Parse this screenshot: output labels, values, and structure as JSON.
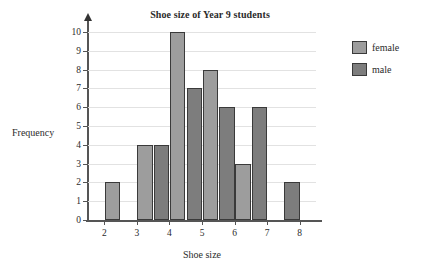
{
  "chart_data": {
    "type": "bar",
    "title": "Shoe size of Year 9 students",
    "xlabel": "Shoe size",
    "ylabel": "Frequency",
    "categories": [
      "2",
      "3",
      "4",
      "5",
      "6",
      "7",
      "8"
    ],
    "xlim": [
      1.5,
      8.5
    ],
    "ylim": [
      0,
      10
    ],
    "ytick_labels": [
      "0",
      "1",
      "2",
      "3",
      "4",
      "5",
      "6",
      "7",
      "8",
      "9",
      "10"
    ],
    "grid": true,
    "legend_position": "right",
    "series": [
      {
        "name": "female",
        "color": "#9d9d9d",
        "values": [
          2,
          4,
          10,
          8,
          3,
          0,
          0
        ]
      },
      {
        "name": "male",
        "color": "#7d7d7d",
        "values": [
          0,
          0,
          4,
          7,
          6,
          6,
          2
        ]
      }
    ],
    "bars": [
      {
        "size": "2",
        "group": "female",
        "value": 2
      },
      {
        "size": "3",
        "group": "female",
        "value": 4
      },
      {
        "size": "4",
        "group": "male",
        "value": 4
      },
      {
        "size": "4",
        "group": "female",
        "value": 10
      },
      {
        "size": "5",
        "group": "male",
        "value": 7
      },
      {
        "size": "5",
        "group": "female",
        "value": 8
      },
      {
        "size": "6",
        "group": "male",
        "value": 6
      },
      {
        "size": "6",
        "group": "female",
        "value": 3
      },
      {
        "size": "7",
        "group": "male",
        "value": 6
      },
      {
        "size": "8",
        "group": "male",
        "value": 2
      }
    ]
  },
  "legend": {
    "items": [
      {
        "label": "female",
        "color": "#9d9d9d"
      },
      {
        "label": "male",
        "color": "#7d7d7d"
      }
    ]
  }
}
